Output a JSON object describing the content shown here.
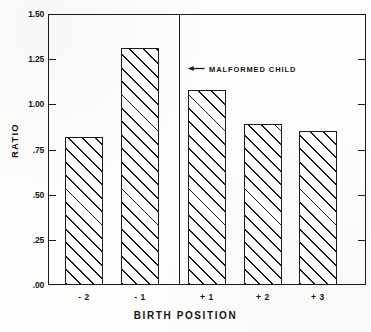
{
  "chart_data": {
    "type": "bar",
    "title": "",
    "subtitle": "",
    "xlabel": "BIRTH POSITION",
    "ylabel": "RATIO",
    "categories": [
      "- 2",
      "- 1",
      "+ 1",
      "+ 2",
      "+ 3"
    ],
    "values": [
      0.82,
      1.31,
      1.08,
      0.89,
      0.85
    ],
    "ylim": [
      0.0,
      1.5
    ],
    "yticks": [
      0.0,
      0.25,
      0.5,
      0.75,
      1.0,
      1.25,
      1.5
    ],
    "ytick_labels": [
      ".00",
      ".25",
      ".50",
      ".75",
      "1.00",
      "1.25",
      "1.50"
    ],
    "grid": false,
    "legend": null,
    "annotations": [
      {
        "text": "MALFORMED CHILD",
        "arrow": "left-arrow-icon",
        "points_to": "divider-between-minus1-and-plus1"
      }
    ],
    "reference_lines": [
      {
        "orientation": "vertical",
        "between": [
          "- 1",
          "+ 1"
        ],
        "label": ""
      }
    ],
    "bar_style": {
      "fill": "diagonal-hatch",
      "fill_color": "#ffffff",
      "line_color": "#1a1a1a"
    }
  },
  "axes": {
    "y_title": "RATIO",
    "x_title": "BIRTH POSITION",
    "y_tick_labels": [
      "1.50",
      "1.25",
      "1.00",
      ".75",
      ".50",
      ".25",
      ".00"
    ],
    "x_tick_labels": [
      "- 2",
      "- 1",
      "+ 1",
      "+ 2",
      "+ 3"
    ]
  },
  "annotation": {
    "label": "MALFORMED CHILD",
    "arrow_glyph": "left-arrow"
  },
  "colors": {
    "ink": "#1a1a1a",
    "paper": "#fdfdfc"
  }
}
